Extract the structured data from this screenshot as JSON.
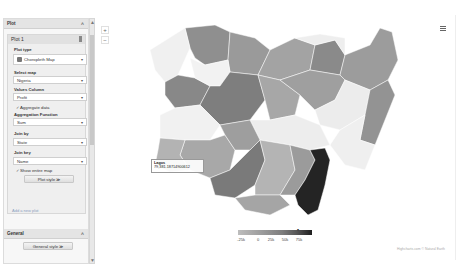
{
  "sidebar": {
    "plot_section": {
      "title": "Plot",
      "collapse_icon": "^"
    },
    "plot_card": {
      "title": "Plot 1",
      "plot_type_label": "Plot type",
      "plot_type_value": "Choropleth Map",
      "select_map_label": "Select map",
      "select_map_value": "Nigeria",
      "value_column_label": "Values Column",
      "value_column_value": "Profit",
      "aggregate_label": "Aggregate data",
      "aggregate_checked": true,
      "aggregation_function_label": "Aggregation Function",
      "aggregation_function_value": "Sum",
      "join_by_label": "Join by",
      "join_by_value": "State",
      "join_key_label": "Join key",
      "join_key_value": "Name",
      "show_entire_map_label": "Show entire map",
      "show_entire_map_checked": true,
      "plot_style_button": "Plot style ≫"
    },
    "add_plot_link": "Add a new plot",
    "general_section": {
      "title": "General",
      "collapse_icon": "^"
    },
    "general_style_button": "General style ≫",
    "caret": "▾",
    "check": "✓"
  },
  "map_controls": {
    "zoom_in": "+",
    "zoom_out": "−"
  },
  "tooltip": {
    "title": "Lagos",
    "value": "79,381.18714900612"
  },
  "legend": {
    "ticks": [
      "-25k",
      "0",
      "25k",
      "50k",
      "75k"
    ],
    "marker": "▾",
    "colors": [
      "#bdbdbd",
      "#9e9e9e",
      "#7d7d7d",
      "#555555",
      "#1e1e1e"
    ]
  },
  "credits": "Highcharts.com © Natural Earth",
  "menu_icon": "hamburger-menu-icon"
}
